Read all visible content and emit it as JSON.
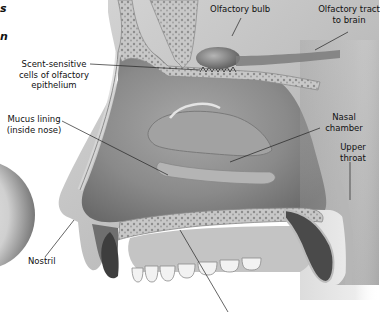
{
  "heading_fragments": [
    "s",
    "n"
  ],
  "labels": {
    "olfactory_bulb": "Olfactory bulb",
    "olfactory_tract": [
      "Olfactory tract",
      "to brain"
    ],
    "scent_cells": [
      "Scent-sensitive",
      "cells of olfactory",
      "epithelium"
    ],
    "mucus_lining": [
      "Mucus lining",
      "(inside nose)"
    ],
    "nasal_chamber": [
      "Nasal",
      "chamber"
    ],
    "upper_throat": [
      "Upper",
      "throat"
    ],
    "nostril": "Nostril"
  },
  "colors": {
    "background": "#ffffff",
    "tissue_dark": "#6f6f6f",
    "tissue_mid": "#9a9a9a",
    "tissue_light": "#cfcfcf",
    "bone": "#bdbdbd",
    "leader_line": "#222222",
    "text": "#111111"
  }
}
